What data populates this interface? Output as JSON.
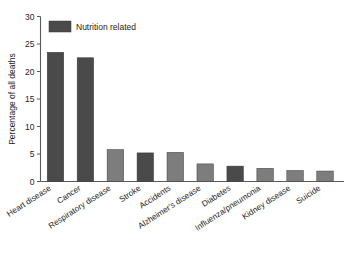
{
  "chart_data": {
    "type": "bar",
    "title": "",
    "xlabel": "",
    "ylabel": "Percentage of all deaths",
    "ylim": [
      0,
      30
    ],
    "yticks": [
      0,
      5,
      10,
      15,
      20,
      25,
      30
    ],
    "ytick_labels": [
      "0",
      "5",
      "10",
      "15",
      "20",
      "25",
      "30"
    ],
    "grid": false,
    "legend": {
      "position": "top-left-inside",
      "entries": [
        {
          "label": "Nutrition related",
          "color": "#4a4a4a"
        }
      ]
    },
    "categories": [
      "Heart disease",
      "Cancer",
      "Respiratory disease",
      "Stroke",
      "Accidents",
      "Alzheimer's disease",
      "Diabetes",
      "Influenza/pneumonia",
      "Kidney disease",
      "Suicide"
    ],
    "values": [
      23.5,
      22.5,
      5.8,
      5.2,
      5.3,
      3.2,
      2.8,
      2.4,
      2.0,
      1.9
    ],
    "nutrition_related": [
      true,
      true,
      false,
      true,
      false,
      false,
      true,
      false,
      false,
      false
    ],
    "bar_colors": [
      "#4a4a4a",
      "#4a4a4a",
      "#7d7d7d",
      "#4a4a4a",
      "#7d7d7d",
      "#7d7d7d",
      "#4a4a4a",
      "#7d7d7d",
      "#7d7d7d",
      "#7d7d7d"
    ]
  },
  "colors": {
    "nutrition_related": "#4a4a4a",
    "other": "#7d7d7d",
    "axis": "#5a5a5a",
    "text": "#1d1d1d",
    "background": "#ffffff"
  }
}
